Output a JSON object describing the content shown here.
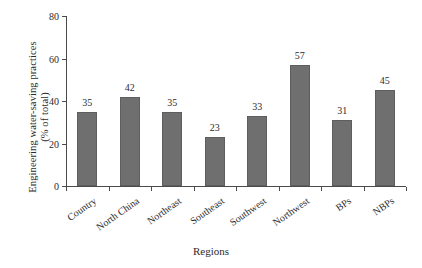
{
  "chart_data": {
    "type": "bar",
    "title": "",
    "subtitle": "",
    "xlabel": "Regions",
    "ylabel": "Engineering water-saving practices (% of total)",
    "ylabel_lines": [
      "Engineering water-saving practices",
      "(% of total)"
    ],
    "categories": [
      "Country",
      "North China",
      "Northeast",
      "Southeast",
      "Southwest",
      "Northwest",
      "BPs",
      "NBPs"
    ],
    "values": [
      35,
      42,
      35,
      23,
      33,
      57,
      31,
      45
    ],
    "value_labels": [
      "35",
      "42",
      "35",
      "23",
      "33",
      "57",
      "31",
      "45"
    ],
    "ylim": [
      0,
      80
    ],
    "yticks": [
      0,
      20,
      40,
      60,
      80
    ],
    "ytick_labels": [
      "0",
      "20",
      "40",
      "60",
      "80"
    ],
    "grid": false,
    "legend": false,
    "legend_position": "none",
    "bar_color": "#6f6f6f",
    "bar_edge_color": "#5e5e5e",
    "axis_color": "#4a4a4a",
    "text_color": "#2b2b2b",
    "background": "#ffffff"
  }
}
